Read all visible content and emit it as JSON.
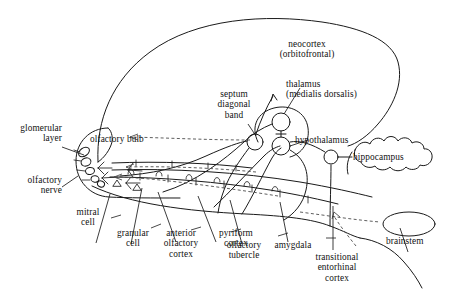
{
  "figure": {
    "type": "anatomical-schematic",
    "background_color": "#ffffff",
    "line_color": "#1a1a1a",
    "dashed_line_color": "#555555",
    "text_color": "#111111"
  },
  "labels": {
    "neocortex": "neocortex\n(orbitofrontal)",
    "thalamus": "thalamus\n(medialis dorsalis)",
    "septum": "septum\ndiagonal\nband",
    "hypothalamus": "hypothalamus",
    "hippocampus": "hippocampus",
    "glomerular_layer": "glomerular\nlayer",
    "olfactory_bulb": "olfactory bulb",
    "olfactory_nerve": "olfactory\nnerve",
    "mitral_cell": "mitral\ncell",
    "granular_cell": "granular\ncell",
    "anterior_olfactory_cortex": "anterior\nolfactory\ncortex",
    "pyriform_cortex": "pyriform\ncortex",
    "olfactory_tubercle": "olfactory\ntubercle",
    "amygdala": "amygdala",
    "transitional_entorhinal_cortex": "transitional\nentorhinal\ncortex",
    "brainstem": "brainstem"
  },
  "label_list": [
    "neocortex (orbitofrontal)",
    "thalamus (medialis dorsalis)",
    "septum diagonal band",
    "hypothalamus",
    "hippocampus",
    "glomerular layer",
    "olfactory bulb",
    "olfactory nerve",
    "mitral cell",
    "granular cell",
    "anterior olfactory cortex",
    "pyriform cortex",
    "olfactory tubercle",
    "amygdala",
    "transitional entorhinal cortex",
    "brainstem"
  ]
}
